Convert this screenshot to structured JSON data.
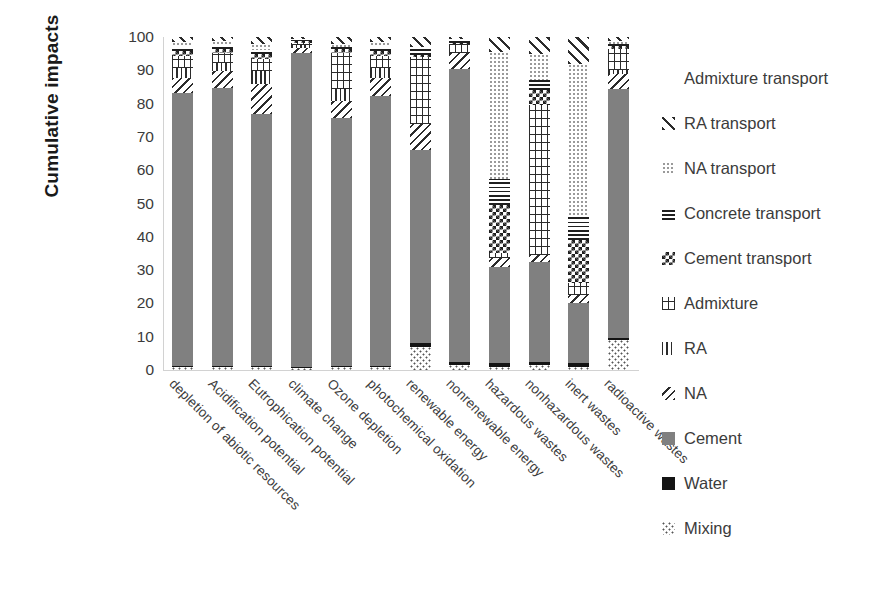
{
  "chart_data": {
    "type": "bar",
    "subtype": "stacked-100-percent",
    "title": "",
    "xlabel": "",
    "ylabel": "Cumulative impacts",
    "ylim": [
      0,
      100
    ],
    "yticks": [
      100,
      90,
      80,
      70,
      60,
      50,
      40,
      30,
      20,
      10,
      0
    ],
    "grid": false,
    "legend_position": "right",
    "categories": [
      "depletion of abiotic resources",
      "Acidification potential",
      "Eutrophication potential",
      "climate change",
      "Ozone depletion",
      "photochemical oxidation",
      "renewable energy",
      "nonrenewable energy",
      "hazardous wastes",
      "nonhazardous wastes",
      "inert wastes",
      "radioactive wastes"
    ],
    "series": [
      {
        "name": "Mixing",
        "pattern": "dotted-sparse",
        "color": "#ffffff",
        "values": [
          0.8,
          0.8,
          0.8,
          0.5,
          0.8,
          0.8,
          7.0,
          1.5,
          1.0,
          1.5,
          1.0,
          9.0
        ]
      },
      {
        "name": "Water",
        "pattern": "solid-black",
        "color": "#141414",
        "values": [
          0.5,
          0.5,
          0.5,
          0.3,
          0.5,
          0.5,
          1.0,
          0.8,
          1.0,
          1.0,
          1.0,
          0.5
        ]
      },
      {
        "name": "Cement",
        "pattern": "solid-gray",
        "color": "#808080",
        "values": [
          82.0,
          83.5,
          75.5,
          94.5,
          74.5,
          81.0,
          58.0,
          88.0,
          29.0,
          30.0,
          18.0,
          75.0
        ]
      },
      {
        "name": "NA",
        "pattern": "diagonal-back",
        "color": "#ffffff",
        "values": [
          4.5,
          5.0,
          9.0,
          1.5,
          5.0,
          5.5,
          8.0,
          5.0,
          2.5,
          2.0,
          2.5,
          4.5
        ]
      },
      {
        "name": "RA",
        "pattern": "vertical-lines",
        "color": "#ffffff",
        "values": [
          3.0,
          2.5,
          4.0,
          0.8,
          3.5,
          3.0,
          0.0,
          0.0,
          0.0,
          0.0,
          0.0,
          1.0
        ]
      },
      {
        "name": "Admixture",
        "pattern": "cross-hatch",
        "color": "#ffffff",
        "values": [
          3.5,
          3.0,
          3.5,
          0.7,
          11.0,
          3.5,
          20.0,
          2.5,
          1.5,
          45.0,
          3.5,
          6.5
        ]
      },
      {
        "name": "Cement transport",
        "pattern": "checkerboard",
        "color": "#ffffff",
        "values": [
          1.5,
          1.2,
          1.5,
          0.4,
          1.0,
          1.5,
          0.5,
          0.5,
          14.5,
          4.5,
          13.0,
          0.8
        ]
      },
      {
        "name": "Concrete transport",
        "pattern": "horizontal-lines",
        "color": "#ffffff",
        "values": [
          1.2,
          1.0,
          1.2,
          0.3,
          0.7,
          1.2,
          2.5,
          0.7,
          8.0,
          3.0,
          7.0,
          0.7
        ]
      },
      {
        "name": "NA transport",
        "pattern": "fine-dotted",
        "color": "#ffffff",
        "values": [
          1.5,
          1.3,
          2.0,
          0.5,
          1.0,
          1.5,
          0.0,
          0.3,
          38.0,
          8.0,
          46.0,
          0.8
        ]
      },
      {
        "name": "RA transport",
        "pattern": "diagonal-fwd",
        "color": "#ffffff",
        "values": [
          1.5,
          1.2,
          2.0,
          0.5,
          2.0,
          1.5,
          3.0,
          0.7,
          4.5,
          5.0,
          8.0,
          1.2
        ]
      },
      {
        "name": "Admixture transport",
        "pattern": "blank-white",
        "color": "#ffffff",
        "values": [
          0.0,
          0.0,
          0.0,
          0.0,
          0.0,
          0.0,
          0.0,
          0.0,
          0.0,
          0.0,
          0.0,
          0.0
        ]
      }
    ]
  },
  "axis": {
    "y_title": "Cumulative impacts"
  },
  "legend": {
    "items": [
      {
        "label": "Admixture transport",
        "key": "admixture-transport"
      },
      {
        "label": "RA transport",
        "key": "ra-transport"
      },
      {
        "label": "NA transport",
        "key": "na-transport"
      },
      {
        "label": "Concrete transport",
        "key": "concrete-transport"
      },
      {
        "label": "Cement transport",
        "key": "cement-transport"
      },
      {
        "label": "Admixture",
        "key": "admixture"
      },
      {
        "label": "RA",
        "key": "ra"
      },
      {
        "label": "NA",
        "key": "na"
      },
      {
        "label": "Cement",
        "key": "cement"
      },
      {
        "label": "Water",
        "key": "water"
      },
      {
        "label": "Mixing",
        "key": "mixing"
      }
    ]
  },
  "colors": {
    "cement": "#808080",
    "water": "#141414",
    "axis": "#d2d2d2",
    "text": "#3b3b3b"
  }
}
